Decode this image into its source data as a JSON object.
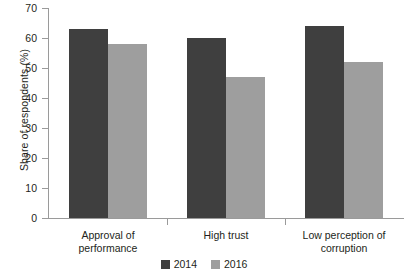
{
  "chart_data": {
    "type": "bar",
    "title": "",
    "subtitle": "",
    "xlabel": "",
    "ylabel": "Share of respondents (%)",
    "ylim": [
      0,
      70
    ],
    "ytick_step": 10,
    "yticks": [
      "70",
      "60",
      "50",
      "40",
      "30",
      "20",
      "10",
      "0"
    ],
    "grid": false,
    "legend_position": "bottom-center",
    "categories": [
      "Approval of performance",
      "High trust",
      "Low perception of corruption"
    ],
    "category_label_lines": [
      [
        "Approval of",
        "performance"
      ],
      [
        "High trust"
      ],
      [
        "Low perception of",
        "corruption"
      ]
    ],
    "series": [
      {
        "name": "2014",
        "color": "#3f3f3f",
        "values": [
          63,
          60,
          64
        ]
      },
      {
        "name": "2016",
        "color": "#9e9e9e",
        "values": [
          58,
          47,
          52
        ]
      }
    ]
  },
  "legend": {
    "entries": [
      {
        "label": "2014",
        "color": "#3f3f3f"
      },
      {
        "label": "2016",
        "color": "#9e9e9e"
      }
    ]
  },
  "colors": {
    "series_2014": "#3f3f3f",
    "series_2016": "#9e9e9e",
    "axis": "#9a9a9a",
    "text": "#231f20",
    "background": "#ffffff"
  }
}
